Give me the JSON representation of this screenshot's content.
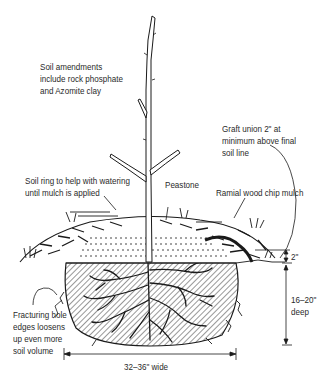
{
  "diagram": {
    "colors": {
      "ink": "#1a1a1a",
      "text": "#2a2a2a",
      "background": "#ffffff"
    },
    "labels": {
      "amendments": [
        "Soil amendments",
        "include rock phosphate",
        "and Azomite clay"
      ],
      "soil_ring": [
        "Soil ring to help with watering",
        "until mulch is applied"
      ],
      "peastone": "Peastone",
      "graft_union": [
        "Graft union 2\" at",
        "minimum above final",
        "soil line"
      ],
      "ramial": "Ramial wood chip mulch",
      "fracturing": [
        "Fracturing hole",
        "edges loosens",
        "up even more",
        "soil volume"
      ],
      "mound_height": "2\"",
      "depth": [
        "16–20\"",
        "deep"
      ],
      "width": "32–36\" wide"
    }
  }
}
